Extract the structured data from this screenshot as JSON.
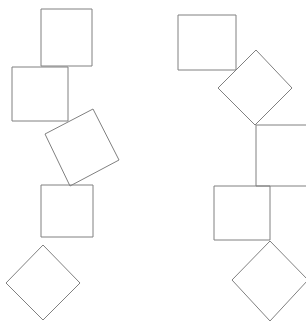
{
  "canvas": {
    "width": 306,
    "height": 333,
    "background_color": "#ffffff",
    "stroke_color": "#808080",
    "stroke_width": 1,
    "fill": "none"
  },
  "figure": {
    "chain_count": 2
  },
  "chains": [
    {
      "name": "left-chain",
      "shape_count": 5,
      "shapes": [
        {
          "name": "left-square-1",
          "kind": "square",
          "rotation_deg": 0,
          "points": "41,9 92,9 92,66 41,66"
        },
        {
          "name": "left-square-2",
          "kind": "square",
          "rotation_deg": 0,
          "points": "12,67 68,67 68,121 12,121"
        },
        {
          "name": "left-diamond-3",
          "kind": "rotated-square",
          "rotation_deg": 20,
          "points": "93,109 119,160 70,186 45,134"
        },
        {
          "name": "left-square-4",
          "kind": "square",
          "rotation_deg": 0,
          "points": "41,185 93,185 93,237 41,237"
        },
        {
          "name": "left-diamond-5",
          "kind": "rotated-square",
          "rotation_deg": 45,
          "points": "43,245 80,283 43,320 6,283"
        }
      ]
    },
    {
      "name": "right-chain",
      "shape_count": 5,
      "shapes": [
        {
          "name": "right-square-1",
          "kind": "square",
          "rotation_deg": 0,
          "points": "178,15 236,15 236,70 178,70"
        },
        {
          "name": "right-diamond-2",
          "kind": "rotated-square",
          "rotation_deg": 45,
          "points": "256,50 292,88 255,125 218,88"
        },
        {
          "name": "right-square-3-clipped",
          "kind": "square",
          "rotation_deg": 0,
          "clipped_edge": "right",
          "points": "256,125 316,125 316,186 256,186"
        },
        {
          "name": "right-square-4",
          "kind": "square",
          "rotation_deg": 0,
          "points": "214,186 270,186 270,240 214,240"
        },
        {
          "name": "right-diamond-5",
          "kind": "rotated-square",
          "rotation_deg": 45,
          "points": "270,241 308,280 270,321 232,280"
        }
      ]
    }
  ]
}
